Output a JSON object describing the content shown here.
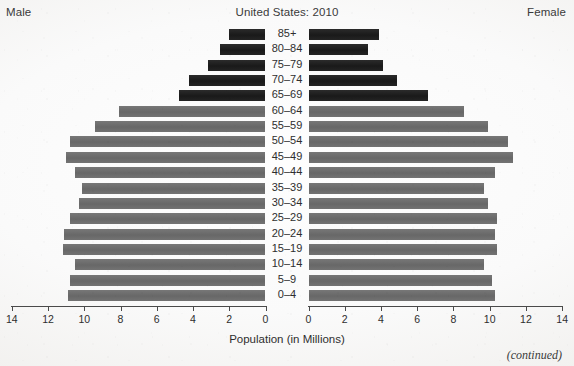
{
  "header": {
    "male_label": "Male",
    "female_label": "Female",
    "title": "United States: 2010"
  },
  "axis": {
    "caption": "Population (in Millions)",
    "left_ticks": [
      "14",
      "12",
      "10",
      "8",
      "6",
      "4",
      "2",
      "0"
    ],
    "right_ticks": [
      "0",
      "2",
      "4",
      "6",
      "8",
      "10",
      "12",
      "14"
    ]
  },
  "footer": {
    "continued": "(continued)"
  },
  "colors": {
    "bar_gray": "#6d6d6d",
    "bar_dark": "#1b1b1b",
    "axis": "#4a4a4a",
    "text": "#2e2e2e",
    "background": "#f4f3f1"
  },
  "chart_data": {
    "type": "bar",
    "subtype": "population-pyramid",
    "title": "United States: 2010",
    "xlabel": "Population (in Millions)",
    "ylabel": "",
    "xlim": [
      0,
      14
    ],
    "grid": false,
    "legend": [
      "Male",
      "Female"
    ],
    "legend_position": "top-left and top-right",
    "categories": [
      "85+",
      "80–84",
      "75–79",
      "70–74",
      "65–69",
      "60–64",
      "55–59",
      "50–54",
      "45–49",
      "40–44",
      "35–39",
      "30–34",
      "25–29",
      "20–24",
      "15–19",
      "10–14",
      "5–9",
      "0–4"
    ],
    "series": [
      {
        "name": "Male",
        "direction": "left",
        "values": [
          2.0,
          2.5,
          3.2,
          4.2,
          4.8,
          8.1,
          9.4,
          10.8,
          11.0,
          10.5,
          10.1,
          10.3,
          10.8,
          11.1,
          11.2,
          10.5,
          10.8,
          10.9
        ]
      },
      {
        "name": "Female",
        "direction": "right",
        "values": [
          3.9,
          3.3,
          4.1,
          4.9,
          6.6,
          8.6,
          9.9,
          11.0,
          11.3,
          10.3,
          9.7,
          9.9,
          10.4,
          10.3,
          10.4,
          9.7,
          10.1,
          10.3
        ]
      }
    ],
    "highlight": {
      "note": "Age groups 65–69 and older are rendered in dark/black; 60–64 and younger in gray",
      "dark_categories": [
        "85+",
        "80–84",
        "75–79",
        "70–74",
        "65–69"
      ]
    }
  }
}
